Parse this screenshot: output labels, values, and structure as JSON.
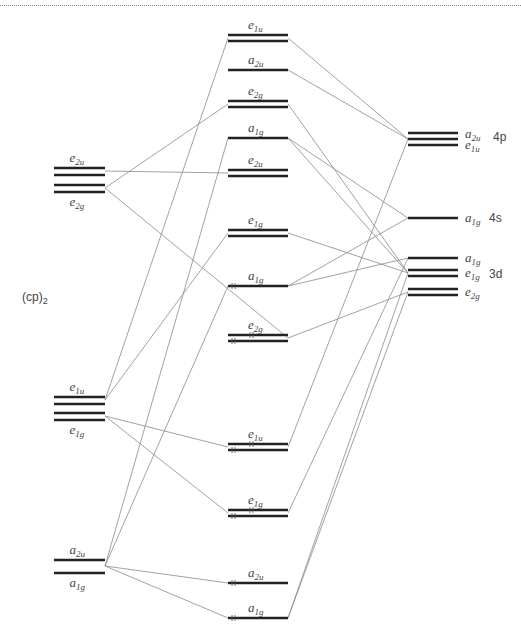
{
  "colors": {
    "level": "#222222",
    "connector": "#8a8a8a",
    "text": "#444444"
  },
  "fragments": {
    "ligand": {
      "label": "(cp)",
      "subscript": "2"
    },
    "metal_4p": "4p",
    "metal_4s": "4s",
    "metal_3d": "3d"
  },
  "columns": {
    "ligand": {
      "x1": 54,
      "x2": 105
    },
    "complex": {
      "x1": 228,
      "x2": 288
    },
    "metal": {
      "x1": 408,
      "x2": 458
    }
  },
  "levels": [
    {
      "id": "L_e2u",
      "col": "ligand",
      "ys": [
        168,
        175
      ],
      "sym": "e",
      "sub": "2u",
      "label_pos": "above"
    },
    {
      "id": "L_e2g",
      "col": "ligand",
      "ys": [
        185,
        192
      ],
      "sym": "e",
      "sub": "2g",
      "label_pos": "below"
    },
    {
      "id": "L_e1u",
      "col": "ligand",
      "ys": [
        397,
        404
      ],
      "sym": "e",
      "sub": "1u",
      "label_pos": "above"
    },
    {
      "id": "L_e1g",
      "col": "ligand",
      "ys": [
        413,
        420
      ],
      "sym": "e",
      "sub": "1g",
      "label_pos": "below"
    },
    {
      "id": "L_a2u",
      "col": "ligand",
      "ys": [
        560
      ],
      "sym": "a",
      "sub": "2u",
      "label_pos": "above"
    },
    {
      "id": "L_a1g",
      "col": "ligand",
      "ys": [
        573
      ],
      "sym": "a",
      "sub": "1g",
      "label_pos": "below"
    },
    {
      "id": "C_e1u_top",
      "col": "complex",
      "ys": [
        35,
        41
      ],
      "sym": "e",
      "sub": "1u",
      "label_pos": "above"
    },
    {
      "id": "C_a2u_top",
      "col": "complex",
      "ys": [
        70
      ],
      "sym": "a",
      "sub": "2u",
      "label_pos": "above"
    },
    {
      "id": "C_e2g_top",
      "col": "complex",
      "ys": [
        101,
        107
      ],
      "sym": "e",
      "sub": "2g",
      "label_pos": "above"
    },
    {
      "id": "C_a1g_top",
      "col": "complex",
      "ys": [
        138
      ],
      "sym": "a",
      "sub": "1g",
      "label_pos": "above"
    },
    {
      "id": "C_e2u",
      "col": "complex",
      "ys": [
        170,
        176
      ],
      "sym": "e",
      "sub": "2u",
      "label_pos": "above"
    },
    {
      "id": "C_e1g_mid",
      "col": "complex",
      "ys": [
        230,
        236
      ],
      "sym": "e",
      "sub": "1g",
      "label_pos": "above"
    },
    {
      "id": "C_a1g_mid",
      "col": "complex",
      "ys": [
        286
      ],
      "sym": "a",
      "sub": "1g",
      "label_pos": "above",
      "electrons": 2
    },
    {
      "id": "C_e2g_mid",
      "col": "complex",
      "ys": [
        335,
        341
      ],
      "sym": "e",
      "sub": "2g",
      "label_pos": "above",
      "electrons": 4
    },
    {
      "id": "C_e1u_low",
      "col": "complex",
      "ys": [
        444,
        450
      ],
      "sym": "e",
      "sub": "1u",
      "label_pos": "above",
      "electrons": 4
    },
    {
      "id": "C_e1g_low",
      "col": "complex",
      "ys": [
        510,
        516
      ],
      "sym": "e",
      "sub": "1g",
      "label_pos": "above",
      "electrons": 4
    },
    {
      "id": "C_a2u_low",
      "col": "complex",
      "ys": [
        583
      ],
      "sym": "a",
      "sub": "2u",
      "label_pos": "above",
      "electrons": 2
    },
    {
      "id": "C_a1g_low",
      "col": "complex",
      "ys": [
        618
      ],
      "sym": "a",
      "sub": "1g",
      "label_pos": "above",
      "electrons": 2
    },
    {
      "id": "M_4p",
      "col": "metal",
      "ys": [
        133,
        139,
        145
      ],
      "sym": "a",
      "sub": "2u",
      "label_pos": "right",
      "extra_sym": "e",
      "extra_sub": "1u"
    },
    {
      "id": "M_4s",
      "col": "metal",
      "ys": [
        218
      ],
      "sym": "a",
      "sub": "1g",
      "label_pos": "right"
    },
    {
      "id": "M_3d_a1g",
      "col": "metal",
      "ys": [
        258
      ],
      "sym": "a",
      "sub": "1g",
      "label_pos": "right"
    },
    {
      "id": "M_3d_e1g",
      "col": "metal",
      "ys": [
        270,
        276
      ],
      "sym": "e",
      "sub": "1g",
      "label_pos": "right"
    },
    {
      "id": "M_3d_e2g",
      "col": "metal",
      "ys": [
        289,
        295
      ],
      "sym": "e",
      "sub": "2g",
      "label_pos": "right"
    }
  ],
  "connectors": [
    [
      105,
      171,
      228,
      173
    ],
    [
      105,
      188,
      288,
      338
    ],
    [
      105,
      188,
      228,
      104
    ],
    [
      105,
      400,
      228,
      38
    ],
    [
      105,
      400,
      228,
      233
    ],
    [
      105,
      416,
      228,
      447
    ],
    [
      105,
      416,
      228,
      513
    ],
    [
      105,
      566,
      228,
      138
    ],
    [
      105,
      566,
      228,
      286
    ],
    [
      105,
      566,
      228,
      583
    ],
    [
      105,
      566,
      228,
      618
    ],
    [
      288,
      38,
      408,
      139
    ],
    [
      288,
      70,
      408,
      139
    ],
    [
      288,
      104,
      408,
      273
    ],
    [
      288,
      138,
      408,
      218
    ],
    [
      288,
      138,
      408,
      273
    ],
    [
      288,
      233,
      408,
      273
    ],
    [
      288,
      286,
      408,
      218
    ],
    [
      288,
      286,
      408,
      258
    ],
    [
      288,
      338,
      408,
      292
    ],
    [
      288,
      447,
      408,
      139
    ],
    [
      288,
      513,
      408,
      258
    ],
    [
      288,
      618,
      408,
      273
    ],
    [
      288,
      618,
      408,
      292
    ]
  ]
}
